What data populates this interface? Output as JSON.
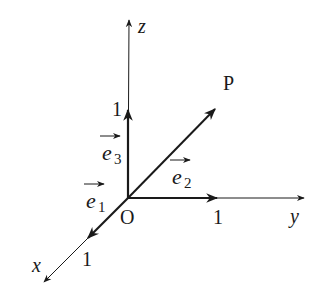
{
  "diagram": {
    "type": "3d-coordinate-system",
    "origin_label": "O",
    "axes": {
      "x": {
        "label": "x",
        "unit_label": "1"
      },
      "y": {
        "label": "y",
        "unit_label": "1"
      },
      "z": {
        "label": "z",
        "unit_label": "1"
      }
    },
    "unit_vectors": {
      "e1": {
        "base": "e",
        "sub": "1",
        "axis": "x"
      },
      "e2": {
        "base": "e",
        "sub": "2",
        "axis": "y"
      },
      "e3": {
        "base": "e",
        "sub": "3",
        "axis": "z"
      }
    },
    "point": {
      "label": "P"
    },
    "vector_arrow": "→",
    "colors": {
      "ink": "#1a1a1a",
      "background": "#ffffff"
    }
  }
}
